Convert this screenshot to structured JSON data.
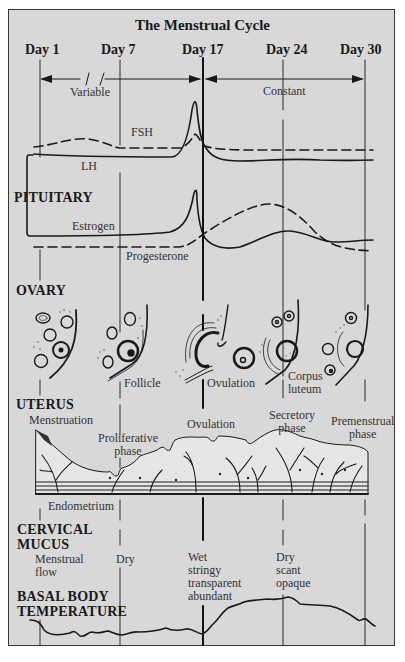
{
  "title": "The Menstrual Cycle",
  "days": [
    {
      "label": "Day 1",
      "x": 40
    },
    {
      "label": "Day 7",
      "x": 120
    },
    {
      "label": "Day 17",
      "x": 203
    },
    {
      "label": "Day 24",
      "x": 283
    },
    {
      "label": "Day 30",
      "x": 365
    }
  ],
  "phase_spans": {
    "variable": "Variable",
    "constant": "Constant"
  },
  "pituitary": {
    "section_label": "PITUITARY",
    "hormones": {
      "fsh": "FSH",
      "lh": "LH",
      "estrogen": "Estrogen",
      "progesterone": "Progesterone"
    }
  },
  "ovary": {
    "section_label": "OVARY",
    "labels": {
      "follicle": "Follicle",
      "ovulation": "Ovulation",
      "corpus_luteum": "Corpus\nluteum"
    }
  },
  "uterus": {
    "section_label": "UTERUS",
    "labels": {
      "menstruation": "Menstruation",
      "proliferative": "Proliferative\nphase",
      "ovulation": "Ovulation",
      "secretory": "Secretory\nphase",
      "premenstrual": "Premenstrual\nphase",
      "endometrium": "Endometrium"
    }
  },
  "cervical_mucus": {
    "section_label_line1": "CERVICAL",
    "section_label_line2": "MUCUS",
    "states": {
      "menstrual": "Menstrual\nflow",
      "dry": "Dry",
      "ovulation": "Wet\nstringy\ntransparent\nabundant",
      "luteal": "Dry\nscant\nopaque"
    }
  },
  "basal_body_temperature": {
    "section_label_line1": "BASAL BODY",
    "section_label_line2": "TEMPERATURE"
  },
  "colors": {
    "background": "#d8d8d8",
    "ink": "#1a1a1a",
    "frame": "#3a3a3a"
  }
}
